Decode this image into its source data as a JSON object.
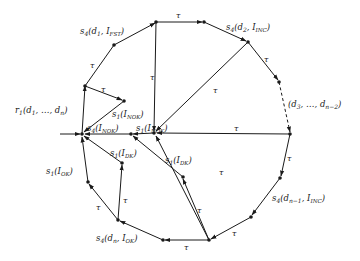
{
  "diagram": {
    "type": "state-transition-graph",
    "labels": {
      "r1": "r₁(d₁, …, dₙ)",
      "s4_fst": "s₄(d₁, Iₒₛₜ)",
      "s4_fst_text": "s4(d1, IFST)",
      "s4_inc2": "s₄(d₂, Iᴵᴺᶜ)",
      "s4_inc2_text": "s4(d2, IINC)",
      "mid_dots": "(d₃, …, dₙ₋₂)",
      "s4_incn1": "s₄(dₙ₋₁, Iᴵᴺᶜ)",
      "s4_okn": "s₄(dₙ, Iₒₖ)",
      "s1_ok": "s₁(Iₒₖ)",
      "s1_dk_left": "s₁(Iᴅₖ)",
      "s1_dk_right": "s₁(Iᴅₖ)",
      "s1_nok_top": "s₁(Iɴₒₖ)",
      "s4_nok": "s₄(Iɴₒₖ)",
      "s1_nok_mid": "s₁(Iɴₒₖ)",
      "tau": "τ"
    },
    "label_parts": {
      "r1": {
        "base": "r",
        "sub": "1",
        "args": "(d",
        "argsub": "1",
        "rest": ", …, d",
        "restsub": "n",
        "end": ")"
      },
      "s4_fst": {
        "base": "s",
        "sub": "4",
        "a": "(d",
        "asub": "1",
        "b": ", I",
        "bsub": "FST",
        "end": ")"
      },
      "s4_inc2": {
        "base": "s",
        "sub": "4",
        "a": "(d",
        "asub": "2",
        "b": ", I",
        "bsub": "INC",
        "end": ")"
      },
      "mid": {
        "a": "(d",
        "asub": "3",
        "b": ", …, d",
        "bsub": "n−2",
        "end": ")"
      },
      "s4_incn1": {
        "base": "s",
        "sub": "4",
        "a": "(d",
        "asub": "n−1",
        "b": ", I",
        "bsub": "INC",
        "end": ")"
      },
      "s4_okn": {
        "base": "s",
        "sub": "4",
        "a": "(d",
        "asub": "n",
        "b": ", I",
        "bsub": "OK",
        "end": ")"
      },
      "s1_ok": {
        "base": "s",
        "sub": "1",
        "a": "(I",
        "asub": "OK",
        "end": ")"
      },
      "s1_dk": {
        "base": "s",
        "sub": "1",
        "a": "(I",
        "asub": "DK",
        "end": ")"
      },
      "s1_nok": {
        "base": "s",
        "sub": "1",
        "a": "(I",
        "asub": "NOK",
        "end": ")"
      },
      "s4_nok": {
        "base": "s",
        "sub": "4",
        "a": "(I",
        "asub": "NOK",
        "end": ")"
      }
    },
    "tau_symbol": "τ",
    "colors": {
      "ink": "#1a1a1a",
      "background": "#ffffff"
    }
  }
}
